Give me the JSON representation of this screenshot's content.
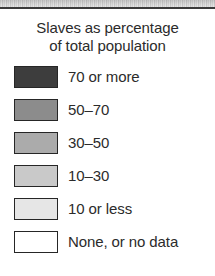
{
  "legend": {
    "title_line1": "Slaves as percentage",
    "title_line2": "of total population",
    "border_color": "#262626",
    "text_color": "#2b2b2b",
    "background_color": "#ffffff",
    "rule_color": "#3a3a3a",
    "entries": [
      {
        "label": "70 or more",
        "color": "#3d3d3d",
        "range_min": 70,
        "range_max": 100
      },
      {
        "label": "50–70",
        "color": "#8c8c8c",
        "range_min": 50,
        "range_max": 70
      },
      {
        "label": "30–50",
        "color": "#ababab",
        "range_min": 30,
        "range_max": 50
      },
      {
        "label": "10–30",
        "color": "#c9c9c9",
        "range_min": 10,
        "range_max": 30
      },
      {
        "label": "10 or less",
        "color": "#e6e6e6",
        "range_min": 0,
        "range_max": 10
      },
      {
        "label": "None, or no data",
        "color": "#ffffff",
        "range_min": null,
        "range_max": null
      }
    ]
  }
}
